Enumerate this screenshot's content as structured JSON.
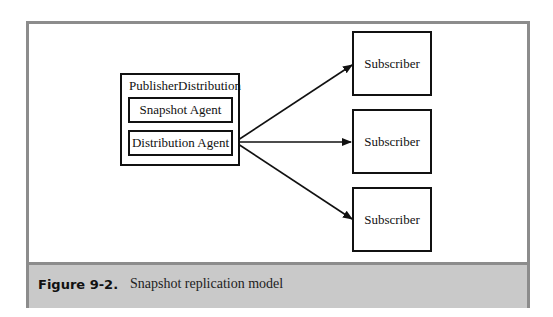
{
  "diagram": {
    "publisher": {
      "title": "PublisherDistribution",
      "agents": [
        {
          "label": "Snapshot Agent"
        },
        {
          "label": "Distribution Agent"
        }
      ]
    },
    "subscribers": [
      {
        "label": "Subscriber"
      },
      {
        "label": "Subscriber"
      },
      {
        "label": "Subscriber"
      }
    ],
    "edges": [
      {
        "from": "Distribution Agent",
        "to": "Subscriber 1"
      },
      {
        "from": "Distribution Agent",
        "to": "Subscriber 2"
      },
      {
        "from": "Distribution Agent",
        "to": "Subscriber 3"
      }
    ]
  },
  "caption": {
    "label": "Figure 9-2.",
    "title": "Snapshot replication model"
  },
  "colors": {
    "frame_border": "#8c8c8c",
    "caption_background": "#c9c9c9",
    "stroke": "#111111"
  }
}
